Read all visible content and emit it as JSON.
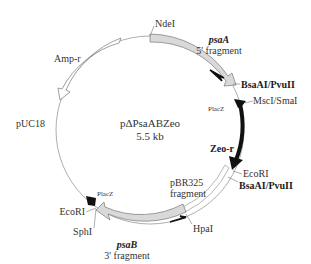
{
  "plasmid": {
    "name": "pΔPsaABZeo",
    "size": "5.5 kb"
  },
  "regions": {
    "backbone": "pUC18",
    "amp": "Amp-r",
    "zeo": "Zeo-r",
    "psaA_gene": "psaA",
    "psaA_frag": "5' fragment",
    "psaB_gene": "psaB",
    "psaB_frag": "3' fragment",
    "pbr_line1": "pBR325",
    "pbr_line2": "fragment",
    "placz_top": "PlacZ",
    "placz_bottom": "PlacZ"
  },
  "sites": {
    "ndei": "NdeI",
    "bsaai_top": "BsaAI/PvuII",
    "msci": "MscI/SmaI",
    "ecori_right": "EcoRI",
    "bsaai_bottom": "BsaAI/PvuII",
    "hpai": "HpaI",
    "ecori_left": "EcoRI",
    "sphi": "SphI"
  },
  "colors": {
    "line": "#888888",
    "fragment_fill": "#d9d9d9",
    "zeo": "#111111"
  }
}
